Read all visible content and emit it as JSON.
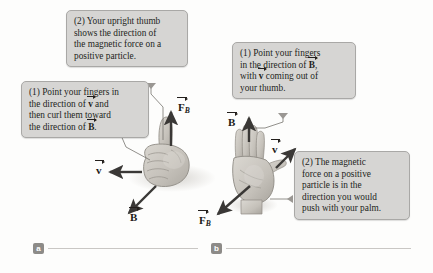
{
  "figure": {
    "panels": [
      {
        "id": "a",
        "label": "a"
      },
      {
        "id": "b",
        "label": "b"
      }
    ]
  },
  "panel_a": {
    "callout_step2": {
      "lines": [
        "(2) Your upright thumb",
        "shows the direction of",
        "the magnetic force on a",
        "positive particle."
      ]
    },
    "callout_step1": {
      "line1_a": "(1) Point your fingers in",
      "line2_a": "the direction of ",
      "line2_vec": "v",
      "line2_b": " and",
      "line3": "then curl them toward",
      "line4_a": "the direction of ",
      "line4_vec": "B",
      "line4_b": "."
    },
    "vectors": [
      {
        "name": "F_B",
        "symbol": "F",
        "subscript": "B",
        "direction": "up"
      },
      {
        "name": "v",
        "symbol": "v",
        "subscript": "",
        "direction": "left"
      },
      {
        "name": "B",
        "symbol": "B",
        "subscript": "",
        "direction": "down-left"
      }
    ],
    "hand": "right fist with upright thumb"
  },
  "panel_b": {
    "callout_step1": {
      "line1": "(1) Point your fingers",
      "line2_a": "in the direction of ",
      "line2_vec": "B",
      "line2_b": ",",
      "line3_a": "with ",
      "line3_vec": "v",
      "line3_b": " coming out of",
      "line4": "your thumb."
    },
    "callout_step2": {
      "lines": [
        "(2) The magnetic",
        "force on a positive",
        "particle is in the",
        "direction you would",
        "push with your palm."
      ]
    },
    "vectors": [
      {
        "name": "B",
        "symbol": "B",
        "subscript": "",
        "direction": "up"
      },
      {
        "name": "v",
        "symbol": "v",
        "subscript": "",
        "direction": "up-right"
      },
      {
        "name": "F_B",
        "symbol": "F",
        "subscript": "B",
        "direction": "down-left"
      }
    ],
    "hand": "right open palm"
  },
  "colors": {
    "callout_bg": "#d6d5d3",
    "callout_border": "#a9a8a6",
    "arrow": "#3a3836",
    "hand_fill": "#c9c6c0",
    "badge_bg": "#8d8b88",
    "rule": "#c9c7c4",
    "text": "#231f1c"
  }
}
